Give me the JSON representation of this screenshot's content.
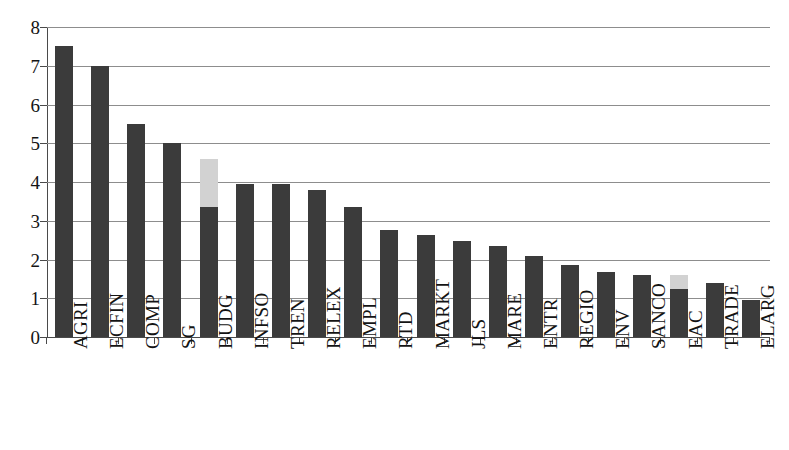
{
  "chart_data": {
    "type": "bar",
    "title": "",
    "subtitle": "",
    "xlabel": "",
    "ylabel": "",
    "ylim": [
      0,
      8
    ],
    "ytick_labels": [
      "8",
      "7",
      "6",
      "5",
      "4",
      "3",
      "2",
      "1",
      "0"
    ],
    "yticks": [
      8,
      7,
      6,
      5,
      4,
      3,
      2,
      1,
      0
    ],
    "grid": true,
    "legend": false,
    "legend_position": "none",
    "stacked": true,
    "categories": [
      "AGRI",
      "ECFIN",
      "COMP",
      "SG",
      "BUDG",
      "INFSO",
      "TREN",
      "RELEX",
      "EMPL",
      "RTD",
      "MARKT",
      "JLS",
      "MARE",
      "ENTR",
      "REGIO",
      "ENV",
      "SANCO",
      "EAC",
      "TRADE",
      "ELARG"
    ],
    "series": [
      {
        "name": "primary",
        "color": "#3b3b3b",
        "values": [
          7.5,
          7.0,
          5.5,
          5.0,
          3.35,
          3.95,
          3.95,
          3.8,
          3.35,
          2.75,
          2.62,
          2.47,
          2.35,
          2.1,
          1.85,
          1.68,
          1.6,
          1.25,
          1.4,
          0.95
        ]
      },
      {
        "name": "secondary",
        "color": "#d2d2d2",
        "values": [
          0,
          0,
          0,
          0,
          1.25,
          0,
          0,
          0,
          0,
          0,
          0,
          0,
          0,
          0,
          0,
          0,
          0,
          0.35,
          0,
          0
        ]
      }
    ],
    "totals": [
      7.5,
      7.0,
      5.5,
      5.0,
      4.6,
      3.95,
      3.95,
      3.8,
      3.35,
      2.75,
      2.62,
      2.47,
      2.35,
      2.1,
      1.85,
      1.68,
      1.6,
      1.6,
      1.4,
      0.95
    ]
  },
  "colors": {
    "bar_primary": "#3b3b3b",
    "bar_secondary": "#d2d2d2",
    "gridline": "#8d8d8d",
    "axis": "#4a4a4a",
    "background": "#ffffff",
    "text": "#141414"
  },
  "geometry": {
    "plot_left": 47,
    "plot_right": 770,
    "plot_top": 27,
    "plot_bottom": 337,
    "bar_width": 18,
    "bar_pitch": 36.15,
    "first_bar_center": 64
  }
}
